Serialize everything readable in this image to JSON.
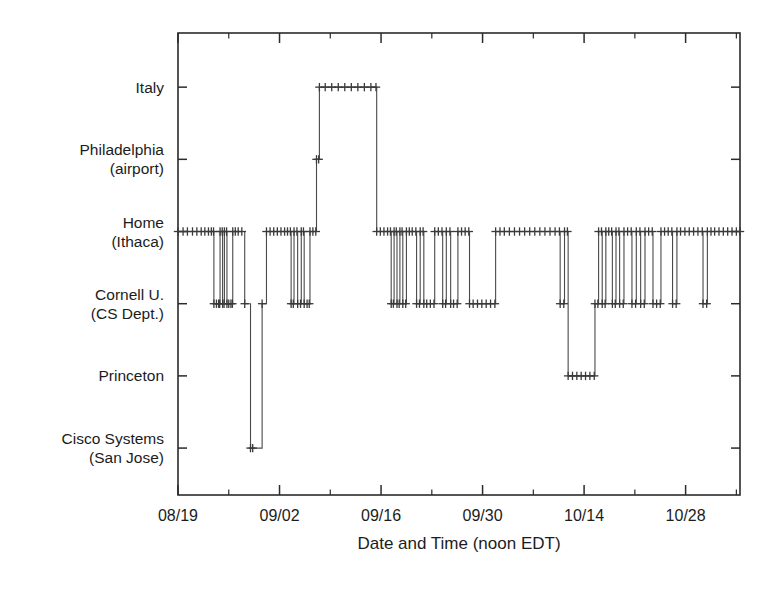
{
  "chart_data": {
    "type": "line",
    "title": "",
    "subtitle": "",
    "xlabel": "Date and Time (noon EDT)",
    "ylabel": "",
    "grid": false,
    "legend": "none",
    "line_color": "#4a4a4a",
    "marker_color": "#3a3a3a",
    "marker_style": "plus",
    "background_color": "#ffffff",
    "axis_color": "#2b2b2b",
    "y_categories": [
      "Italy",
      "Philadelphia\n(airport)",
      "Home\n(Ithaca)",
      "Cornell U.\n(CS Dept.)",
      "Princeton",
      "Cisco Systems\n(San Jose)"
    ],
    "y_tick_labels": [
      {
        "lines": [
          "Italy"
        ],
        "value": 6
      },
      {
        "lines": [
          "Philadelphia",
          "(airport)"
        ],
        "value": 5
      },
      {
        "lines": [
          "Home",
          "(Ithaca)"
        ],
        "value": 4
      },
      {
        "lines": [
          "Cornell U.",
          "(CS Dept.)"
        ],
        "value": 3
      },
      {
        "lines": [
          "Princeton"
        ],
        "value": 2
      },
      {
        "lines": [
          "Cisco Systems",
          "(San Jose)"
        ],
        "value": 1
      }
    ],
    "ylim": [
      0.35,
      6.75
    ],
    "x_tick_labels": [
      "08/19",
      "09/02",
      "09/16",
      "09/30",
      "10/14",
      "10/28"
    ],
    "x_tick_values": [
      0,
      14,
      28,
      42,
      56,
      70
    ],
    "x_minor_interval": 7,
    "xlim": [
      0,
      77.5
    ],
    "series": [
      {
        "name": "location",
        "step": "post",
        "points": [
          [
            0.0,
            4
          ],
          [
            0.7,
            4
          ],
          [
            1.3,
            4
          ],
          [
            2.0,
            4
          ],
          [
            2.6,
            4
          ],
          [
            3.2,
            4
          ],
          [
            3.7,
            4
          ],
          [
            4.2,
            4
          ],
          [
            4.6,
            4
          ],
          [
            4.9,
            4
          ],
          [
            4.95,
            3
          ],
          [
            5.3,
            3
          ],
          [
            5.6,
            3
          ],
          [
            5.75,
            3
          ],
          [
            5.8,
            4
          ],
          [
            6.1,
            4
          ],
          [
            6.15,
            3
          ],
          [
            6.35,
            3
          ],
          [
            6.4,
            4
          ],
          [
            6.7,
            4
          ],
          [
            6.75,
            3
          ],
          [
            7.0,
            3
          ],
          [
            7.3,
            3
          ],
          [
            7.5,
            3
          ],
          [
            7.55,
            4
          ],
          [
            7.9,
            4
          ],
          [
            8.3,
            4
          ],
          [
            8.8,
            4
          ],
          [
            9.2,
            3
          ],
          [
            10.0,
            1
          ],
          [
            10.3,
            1
          ],
          [
            11.6,
            3
          ],
          [
            12.2,
            4
          ],
          [
            12.7,
            4
          ],
          [
            13.2,
            4
          ],
          [
            13.7,
            4
          ],
          [
            14.2,
            4
          ],
          [
            14.7,
            4
          ],
          [
            15.1,
            4
          ],
          [
            15.5,
            4
          ],
          [
            15.6,
            3
          ],
          [
            15.9,
            3
          ],
          [
            16.0,
            4
          ],
          [
            16.4,
            4
          ],
          [
            16.5,
            3
          ],
          [
            16.9,
            3
          ],
          [
            17.0,
            4
          ],
          [
            17.3,
            4
          ],
          [
            17.4,
            3
          ],
          [
            17.8,
            3
          ],
          [
            18.1,
            3
          ],
          [
            18.2,
            4
          ],
          [
            18.6,
            4
          ],
          [
            19.0,
            4
          ],
          [
            19.1,
            5
          ],
          [
            19.4,
            5
          ],
          [
            19.5,
            6
          ],
          [
            20.3,
            6
          ],
          [
            21.2,
            6
          ],
          [
            22.1,
            6
          ],
          [
            23.0,
            6
          ],
          [
            23.9,
            6
          ],
          [
            24.8,
            6
          ],
          [
            25.7,
            6
          ],
          [
            26.6,
            6
          ],
          [
            27.3,
            6
          ],
          [
            27.4,
            4
          ],
          [
            27.9,
            4
          ],
          [
            28.4,
            4
          ],
          [
            28.9,
            4
          ],
          [
            29.3,
            4
          ],
          [
            29.4,
            3
          ],
          [
            29.7,
            3
          ],
          [
            29.8,
            4
          ],
          [
            30.1,
            4
          ],
          [
            30.2,
            3
          ],
          [
            30.5,
            3
          ],
          [
            30.6,
            4
          ],
          [
            30.9,
            4
          ],
          [
            31.0,
            3
          ],
          [
            31.4,
            3
          ],
          [
            31.5,
            4
          ],
          [
            31.9,
            4
          ],
          [
            32.3,
            4
          ],
          [
            32.8,
            4
          ],
          [
            32.9,
            3
          ],
          [
            33.3,
            3
          ],
          [
            33.4,
            4
          ],
          [
            33.8,
            4
          ],
          [
            33.9,
            3
          ],
          [
            34.3,
            3
          ],
          [
            34.8,
            3
          ],
          [
            35.3,
            3
          ],
          [
            35.4,
            4
          ],
          [
            35.9,
            4
          ],
          [
            36.4,
            4
          ],
          [
            36.5,
            3
          ],
          [
            36.9,
            3
          ],
          [
            37.0,
            4
          ],
          [
            37.5,
            4
          ],
          [
            37.6,
            3
          ],
          [
            38.0,
            3
          ],
          [
            38.5,
            3
          ],
          [
            38.6,
            4
          ],
          [
            39.1,
            4
          ],
          [
            39.6,
            4
          ],
          [
            40.1,
            4
          ],
          [
            40.2,
            3
          ],
          [
            40.7,
            3
          ],
          [
            41.3,
            3
          ],
          [
            41.9,
            3
          ],
          [
            42.5,
            3
          ],
          [
            43.1,
            3
          ],
          [
            43.7,
            3
          ],
          [
            43.8,
            4
          ],
          [
            44.4,
            4
          ],
          [
            45.0,
            4
          ],
          [
            45.7,
            4
          ],
          [
            46.4,
            4
          ],
          [
            47.1,
            4
          ],
          [
            47.8,
            4
          ],
          [
            48.5,
            4
          ],
          [
            49.2,
            4
          ],
          [
            49.9,
            4
          ],
          [
            50.6,
            4
          ],
          [
            51.3,
            4
          ],
          [
            52.0,
            4
          ],
          [
            52.6,
            4
          ],
          [
            52.7,
            3
          ],
          [
            53.2,
            3
          ],
          [
            53.3,
            4
          ],
          [
            53.7,
            4
          ],
          [
            53.8,
            2
          ],
          [
            54.4,
            2
          ],
          [
            55.0,
            2
          ],
          [
            55.6,
            2
          ],
          [
            56.2,
            2
          ],
          [
            56.8,
            2
          ],
          [
            57.4,
            2
          ],
          [
            57.5,
            3
          ],
          [
            57.9,
            3
          ],
          [
            58.0,
            4
          ],
          [
            58.4,
            4
          ],
          [
            58.5,
            3
          ],
          [
            58.9,
            3
          ],
          [
            59.0,
            4
          ],
          [
            59.4,
            4
          ],
          [
            59.8,
            4
          ],
          [
            59.9,
            3
          ],
          [
            60.3,
            3
          ],
          [
            60.4,
            4
          ],
          [
            60.8,
            4
          ],
          [
            60.9,
            3
          ],
          [
            61.4,
            3
          ],
          [
            61.5,
            4
          ],
          [
            62.0,
            4
          ],
          [
            62.5,
            4
          ],
          [
            62.6,
            3
          ],
          [
            63.1,
            3
          ],
          [
            63.2,
            4
          ],
          [
            63.7,
            4
          ],
          [
            63.8,
            3
          ],
          [
            64.3,
            3
          ],
          [
            64.4,
            4
          ],
          [
            64.9,
            4
          ],
          [
            65.4,
            4
          ],
          [
            65.5,
            3
          ],
          [
            66.0,
            3
          ],
          [
            66.5,
            3
          ],
          [
            66.6,
            4
          ],
          [
            67.1,
            4
          ],
          [
            67.6,
            4
          ],
          [
            68.1,
            4
          ],
          [
            68.2,
            3
          ],
          [
            68.7,
            3
          ],
          [
            68.8,
            4
          ],
          [
            69.3,
            4
          ],
          [
            69.9,
            4
          ],
          [
            70.5,
            4
          ],
          [
            71.1,
            4
          ],
          [
            71.7,
            4
          ],
          [
            72.3,
            4
          ],
          [
            72.4,
            3
          ],
          [
            72.9,
            3
          ],
          [
            73.0,
            4
          ],
          [
            73.5,
            4
          ],
          [
            74.0,
            4
          ],
          [
            74.6,
            4
          ],
          [
            75.2,
            4
          ],
          [
            75.8,
            4
          ],
          [
            76.4,
            4
          ],
          [
            77.0,
            4
          ],
          [
            77.5,
            4
          ]
        ]
      }
    ],
    "annotations": []
  },
  "ghost_artifact": {
    "text": "scan artifact"
  }
}
